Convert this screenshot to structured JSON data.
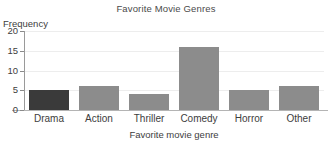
{
  "chart_data": {
    "type": "bar",
    "title": "Favorite Movie Genres",
    "xlabel": "Favorite movie genre",
    "ylabel": "Frequency",
    "categories": [
      "Drama",
      "Action",
      "Thriller",
      "Comedy",
      "Horror",
      "Other"
    ],
    "values": [
      5,
      6,
      4,
      16,
      5,
      6
    ],
    "ylim": [
      0,
      20
    ],
    "yticks": [
      0,
      5,
      10,
      15,
      20
    ],
    "ytick_labels": [
      "0",
      "5",
      "10",
      "15",
      "20"
    ],
    "grid": "horizontal",
    "legend": "none",
    "bar_colors": [
      "#3a3a3a",
      "#8c8c8c",
      "#8c8c8c",
      "#8c8c8c",
      "#8c8c8c",
      "#8c8c8c"
    ],
    "highlighted_category": "Drama",
    "colors": {
      "bar_default": "#8c8c8c",
      "bar_highlight": "#3a3a3a",
      "gridline": "#ededed",
      "axis": "#9a9a9a",
      "text": "#3d3d3d",
      "background": "#ffffff"
    }
  }
}
